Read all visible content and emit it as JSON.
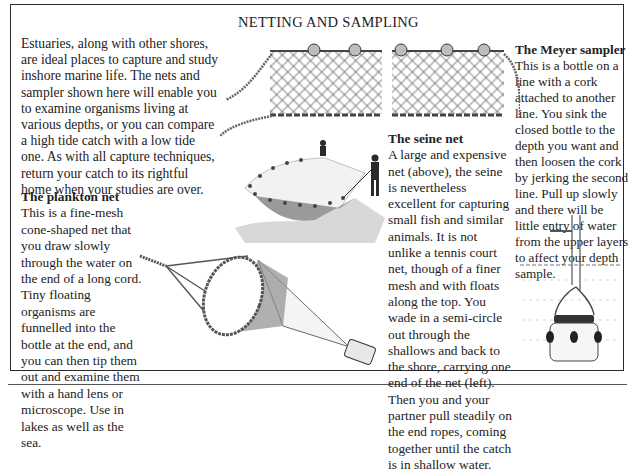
{
  "page": {
    "title": "NETTING AND SAMPLING"
  },
  "intro": {
    "text": "Estuaries, along with other shores, are ideal places to capture and study inshore marine life. The nets and sampler shown here will enable you to examine organisms living at various depths, or you can compare a high tide catch with a low tide one. As with all capture techniques, return your catch to its rightful home when your studies are over."
  },
  "sections": {
    "plankton": {
      "heading": "The plankton net",
      "body": "This is a fine-mesh cone-shaped net that you draw slowly through the water on the end of a long cord. Tiny floating organisms are funnelled into the bottle at the end, and you can then tip them out and examine them with a hand lens or microscope. Use in lakes as well as the sea."
    },
    "seine": {
      "heading": "The seine net",
      "body": "A large and expensive net (above), the seine is nevertheless excellent for capturing small fish and similar animals. It is not unlike a tennis court net, though of a finer mesh and with floats along the top. You wade in a semi-circle out through the shallows and back to the shore, carrying one end of the net (left). Then you and your partner pull steadily on the end ropes, coming together until the catch is in shallow water."
    },
    "meyer": {
      "heading": "The Meyer sampler",
      "body": "This is a bottle on a line with a cork attached to another line. You sink the closed bottle to the depth you want and then loosen the cork by jerking the second line. Pull up slowly and there will be little entry of water from the upper layers to affect your depth sample."
    }
  },
  "illustrations": {
    "seine_net": "seine-net-illustration",
    "seine_in_use": "seine-net-in-use-illustration",
    "plankton_net": "plankton-net-illustration",
    "meyer_sampler": "meyer-sampler-illustration"
  }
}
